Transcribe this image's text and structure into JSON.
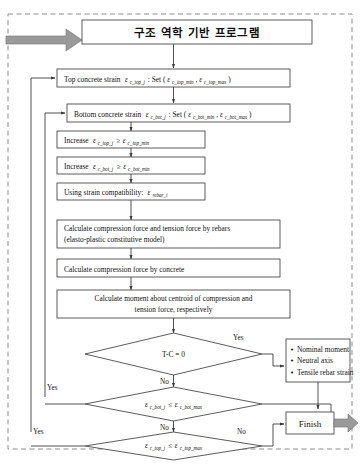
{
  "diagram": {
    "title": "구조 역학 기반 프로그램",
    "frame_style": "dashed-border",
    "entry_arrow": "gray-thick-arrow-right",
    "exit_arrow": "gray-thick-arrow-right",
    "nodes": [
      {
        "id": "title",
        "type": "process",
        "label": "구조 역학 기반 프로그램"
      },
      {
        "id": "top-strain",
        "type": "process",
        "label": "Top concrete strain",
        "symbol": "ε",
        "symbol_sub": "c_top_j",
        "label2": ": Set (",
        "symbol2": "ε",
        "symbol2_sub": "c_top_min",
        "sep": ", ",
        "symbol3": "ε",
        "symbol3_sub": "c_top_max",
        "tail": ")"
      },
      {
        "id": "bottom-strain",
        "type": "process",
        "label": "Bottom concrete strain",
        "symbol": "ε",
        "symbol_sub": "c_bot_j",
        "label2": ": Set (",
        "symbol2": "ε",
        "symbol2_sub": "c_bot_min",
        "sep": ", ",
        "symbol3": "ε",
        "symbol3_sub": "c_bot_max",
        "tail": ")"
      },
      {
        "id": "increase-top",
        "type": "process",
        "label": "Increase",
        "symbol": "ε",
        "symbol_sub": "c_top_j",
        "op": "≥",
        "symbol2": "ε",
        "symbol2_sub": "c_top_min"
      },
      {
        "id": "increase-bot",
        "type": "process",
        "label": "Increase",
        "symbol": "ε",
        "symbol_sub": "c_bot_j",
        "op": "≥",
        "symbol2": "ε",
        "symbol2_sub": "c_bot_min"
      },
      {
        "id": "strain-compatibility",
        "type": "process",
        "label": "Using strain compatibility:",
        "symbol": "ε",
        "symbol_sub": "rebar_i"
      },
      {
        "id": "calc-rebar-force",
        "type": "process",
        "line1": "Calculate compression force and tension force by rebars",
        "line2": "(elasto-plastic constitutive model)"
      },
      {
        "id": "calc-concrete-force",
        "type": "process",
        "line1": "Calculate compression force by concrete"
      },
      {
        "id": "calc-moment",
        "type": "process",
        "line1": "Calculate moment about centroid of compression and",
        "line2": "tension force, respectively"
      },
      {
        "id": "decision-tc",
        "type": "decision",
        "label": "T-C = 0",
        "yes_label": "Yes",
        "no_label": "No"
      },
      {
        "id": "results",
        "type": "list",
        "items": [
          "Nominal moment",
          "Neutral axis",
          "Tensile rebar strain"
        ]
      },
      {
        "id": "decision-bot-max",
        "type": "decision",
        "symbol": "ε",
        "symbol_sub": "c_bot_j",
        "op": "≤",
        "symbol2": "ε",
        "symbol2_sub": "c_bot_max",
        "yes_label": "Yes",
        "no_label": "No"
      },
      {
        "id": "decision-top-max",
        "type": "decision",
        "symbol": "ε",
        "symbol_sub": "c_top_j",
        "op": "≤",
        "symbol2": "ε",
        "symbol2_sub": "c_top_max",
        "yes_label": "Yes",
        "no_label": "No"
      },
      {
        "id": "finish",
        "type": "terminator",
        "label": "Finish"
      }
    ],
    "edge_labels": {
      "tc_yes": "Yes",
      "tc_no": "No",
      "bot_yes": "Yes",
      "bot_no": "No",
      "top_yes": "Yes",
      "top_no": "No"
    },
    "colors": {
      "stroke": "#4a4a4a",
      "frame": "#8d8d8d",
      "arrow_fill": "#9a9a9a",
      "text": "#111111",
      "background": "#ffffff"
    }
  }
}
